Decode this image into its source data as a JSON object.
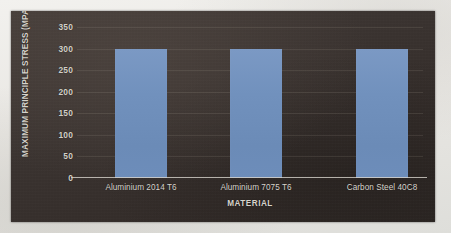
{
  "chart_data": {
    "type": "bar",
    "title": "",
    "subtitle": "",
    "xlabel": "MATERIAL",
    "ylabel": "MAXIMUM PRINCIPLE STRESS (MPA)",
    "categories": [
      "Aluminium 2014 T6",
      "Aluminium 7075 T6",
      "Carbon Steel 40C8"
    ],
    "values": [
      300,
      300,
      300
    ],
    "series": [
      {
        "name": "Maximum Principle Stress",
        "values": [
          300,
          300,
          300
        ]
      }
    ],
    "ylim": [
      0,
      350
    ],
    "ytick_step": 50,
    "yticks": [
      350,
      300,
      250,
      200,
      150,
      100,
      50,
      0
    ],
    "ytick_labels": [
      "350",
      "300",
      "250",
      "200",
      "150",
      "100",
      "50",
      "0"
    ],
    "grid": true,
    "grid_axis": "y",
    "legend": false,
    "legend_position": "none",
    "annotations": [],
    "bar_color": "#7191bd",
    "plot_background": "#3a3330",
    "text_color": "#d7d3cc",
    "axis_line_color": "#d8d4cd",
    "page_background": "#e9e7e3"
  }
}
